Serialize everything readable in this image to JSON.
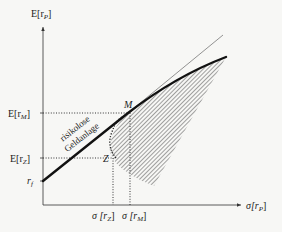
{
  "diagram": {
    "type": "capital-market-line",
    "colors": {
      "background": "#f7f7f5",
      "axis": "#333333",
      "frontier": "#111111",
      "tangent": "#777777",
      "hatch": "#555555",
      "guides": "#333333"
    },
    "y_axis": {
      "label": "E[r_P]",
      "label_main": "E[r",
      "label_sub": "P",
      "label_close": "]"
    },
    "x_axis": {
      "label": "σ[r_P]",
      "label_main": "σ[r",
      "label_sub": "P",
      "label_close": "]"
    },
    "y_ticks": [
      {
        "id": "erm",
        "main": "E[r",
        "sub": "M",
        "close": "]"
      },
      {
        "id": "erz",
        "main": "E[r",
        "sub": "Z",
        "close": "]"
      },
      {
        "id": "rf",
        "main": "r",
        "sub": "f",
        "close": ""
      }
    ],
    "x_ticks": [
      {
        "id": "srz",
        "main": "σ [r",
        "sub": "Z",
        "close": "]"
      },
      {
        "id": "srm",
        "main": "σ [r",
        "sub": "M",
        "close": "]"
      }
    ],
    "points": {
      "M": {
        "label": "M",
        "description": "Marktportfolio (tangency point)"
      },
      "Z": {
        "label": "Z",
        "description": "Minimum-variance portfolio"
      }
    },
    "line_label": {
      "line1": "risikolose",
      "line2": "Geldanlage"
    },
    "regions": {
      "hatched": "Opportunity set of risky portfolios",
      "thick_line": "Capital market line from r_f through M continuing along efficient frontier",
      "thin_line": "Tangent line extension beyond M"
    }
  }
}
